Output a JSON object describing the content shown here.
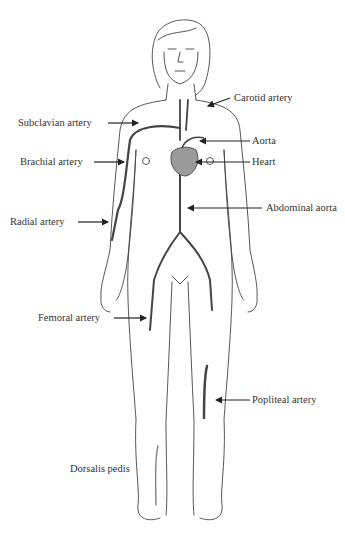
{
  "diagram": {
    "colors": {
      "line": "#444444",
      "heart_fill": "#9a9a9a",
      "text": "#333333",
      "background": "#ffffff"
    },
    "labels": [
      {
        "id": "carotid",
        "text": "Carotid artery"
      },
      {
        "id": "subclavian",
        "text": "Subclavian artery"
      },
      {
        "id": "aorta",
        "text": "Aorta"
      },
      {
        "id": "brachial",
        "text": "Brachial artery"
      },
      {
        "id": "heart",
        "text": "Heart"
      },
      {
        "id": "abdominal-aorta",
        "text": "Abdominal aorta"
      },
      {
        "id": "radial",
        "text": "Radial artery"
      },
      {
        "id": "femoral",
        "text": "Femoral artery"
      },
      {
        "id": "popliteal",
        "text": "Popliteal artery"
      },
      {
        "id": "dorsalis-pedis",
        "text": "Dorsalis pedis"
      }
    ]
  }
}
